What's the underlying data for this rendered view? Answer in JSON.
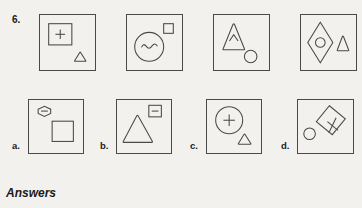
{
  "page": {
    "question_number": "6.",
    "answers_heading": "Answers",
    "background_color": "#f2f1ee",
    "ink_color": "#4a4a4a"
  },
  "question_row": {
    "label": "6.",
    "panels": [
      {
        "id": "q1",
        "name": "question-panel-1",
        "shapes": [
          "square-with-plus",
          "small-triangle"
        ],
        "description": "Large square containing a plus sign, small triangle at bottom right"
      },
      {
        "id": "q2",
        "name": "question-panel-2",
        "shapes": [
          "circle-with-wave",
          "small-square"
        ],
        "description": "Circle containing a wavy line, small square at top right"
      },
      {
        "id": "q3",
        "name": "question-panel-3",
        "shapes": [
          "triangle-with-caret",
          "small-circle"
        ],
        "description": "Triangle containing a caret, small circle at bottom right"
      },
      {
        "id": "q4",
        "name": "question-panel-4",
        "shapes": [
          "diamond-with-circle",
          "small-triangle"
        ],
        "description": "Diamond containing a circle, small triangle to the right"
      }
    ]
  },
  "option_row": {
    "options": [
      {
        "id": "a",
        "label": "a.",
        "name": "option-panel-a",
        "shapes": [
          "hexagon-with-dash",
          "square"
        ],
        "description": "Small hexagon containing a dash at top left, large square at bottom right"
      },
      {
        "id": "b",
        "label": "b.",
        "name": "option-panel-b",
        "shapes": [
          "triangle",
          "small-square-with-dash"
        ],
        "description": "Large triangle at left, small square containing a dash at top right"
      },
      {
        "id": "c",
        "label": "c.",
        "name": "option-panel-c",
        "shapes": [
          "circle-with-plus",
          "small-triangle"
        ],
        "description": "Circle containing a plus sign, small triangle at bottom right"
      },
      {
        "id": "d",
        "label": "d.",
        "name": "option-panel-d",
        "shapes": [
          "tilted-square-with-cross",
          "small-circle"
        ],
        "description": "Tilted square containing a rotated cross, small circle at bottom left"
      }
    ]
  }
}
